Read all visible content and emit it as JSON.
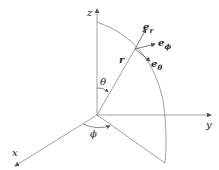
{
  "diagram": {
    "axes": {
      "z": "z",
      "y": "y",
      "x": "x"
    },
    "angles": {
      "theta": "θ",
      "phi": "ϕ"
    },
    "vector": {
      "r": "r"
    },
    "unit_vectors": {
      "e_r": {
        "base": "e",
        "sub": "r"
      },
      "e_phi": {
        "base": "e",
        "sub": "ϕ"
      },
      "e_theta": {
        "base": "e",
        "sub": "θ"
      }
    },
    "colors": {
      "line": "#888888",
      "text": "#222222"
    }
  }
}
